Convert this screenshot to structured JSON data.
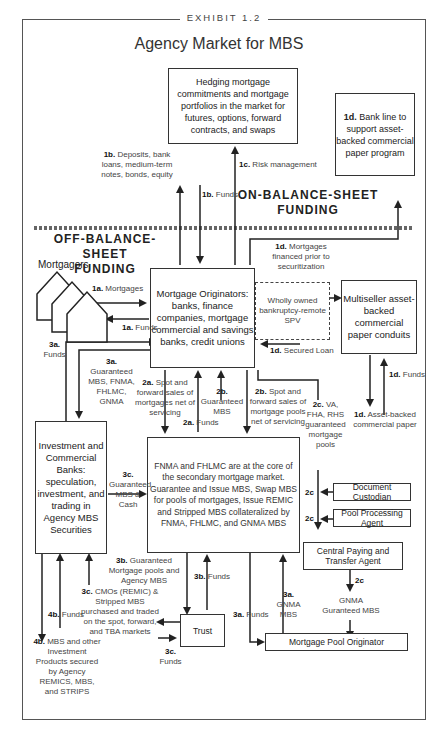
{
  "exhibit": "EXHIBIT 1.2",
  "title": "Agency Market for MBS",
  "sections": {
    "on_balance": "ON-BALANCE-SHEET FUNDING",
    "off_balance": "OFF-BALANCE-SHEET FUNDING"
  },
  "nodes": {
    "hedging": "Hedging mortgage commitments and mortgage portfolios in the market for futures, options, forward contracts, and swaps",
    "bank_line": {
      "tag": "1d.",
      "text": "Bank line to support asset-backed commercial paper program"
    },
    "mortgagors": "Mortgagors",
    "originators": "Mortgage Originators: banks, finance companies, mortgage commercial and savings banks, credit unions",
    "spv": "Wholly owned bankruptcy-remote SPV",
    "conduits": "Multiseller asset-backed commercial paper conduits",
    "investment_banks": "Investment and Commercial Banks: speculation, investment, and trading in Agency MBS Securities",
    "fnma": "FNMA and FHLMC are at the core of the secondary mortgage market. Guarantee and Issue MBS, Swap MBS for pools of mortgages, Issue REMIC and Stripped MBS collateralized by FNMA, FHLMC, and GNMA MBS",
    "document_custodian": "Document Custodian",
    "pool_processing": "Pool Processing Agent",
    "central_paying": "Central Paying and Transfer Agent",
    "trust": "Trust",
    "pool_originator": "Mortgage Pool Originator"
  },
  "labels": {
    "l1b_deposits": {
      "tag": "1b.",
      "text": "Deposits, bank loans, medium-term notes, bonds, equity"
    },
    "l1b_funds": {
      "tag": "1b.",
      "text": "Funds"
    },
    "l1c": {
      "tag": "1c.",
      "text": "Risk management"
    },
    "l1a_mortgages": {
      "tag": "1a.",
      "text": "Mortgages"
    },
    "l1a_funds": {
      "tag": "1a.",
      "text": "Funds"
    },
    "l1d_mortgages": {
      "tag": "1d.",
      "text": "Mortgages financed prior to securitization"
    },
    "l1d_secured": {
      "tag": "1d.",
      "text": "Secured Loan"
    },
    "l1d_funds": {
      "tag": "1d.",
      "text": "Funds"
    },
    "l1d_abcp": {
      "tag": "1d.",
      "text": "Asset-backed commercial paper"
    },
    "l3a_funds_left": {
      "tag": "3a.",
      "text": "Funds"
    },
    "l3a_guaranteed": {
      "tag": "3a.",
      "text": "Guaranteed MBS, FNMA, FHLMC, GNMA"
    },
    "l2a_spot": {
      "tag": "2a.",
      "text": "Spot and forward sales of mortgages net of servicing"
    },
    "l2a_funds": {
      "tag": "2a.",
      "text": "Funds"
    },
    "l2b_guaranteed": {
      "tag": "2b.",
      "text": "Guaranteed MBS"
    },
    "l2b_spot": {
      "tag": "2b.",
      "text": "Spot and forward sales of mortgage pools net of servicing"
    },
    "l2c_va": {
      "tag": "2c.",
      "text": "VA, FHA, RHS guaranteed mortgage pools"
    },
    "l2c_1": {
      "tag": "2c",
      "text": ""
    },
    "l2c_2": {
      "tag": "2c",
      "text": ""
    },
    "l2c_3": {
      "tag": "2c",
      "text": ""
    },
    "l3c_guaranteed": {
      "tag": "3c.",
      "text": "Guaranteed MBS & Cash"
    },
    "l3b_guaranteed": {
      "tag": "3b.",
      "text": "Guaranteed Mortgage pools and Agency MBS"
    },
    "l3b_funds": {
      "tag": "3b.",
      "text": "Funds"
    },
    "l3c_cmos": {
      "tag": "3c.",
      "text": "CMOs (REMIC) & Stripped MBS purchased and traded on the spot, forward, and TBA markets"
    },
    "l3c_funds": {
      "tag": "3c.",
      "text": "Funds"
    },
    "l3a_funds_right": {
      "tag": "3a.",
      "text": "Funds"
    },
    "l3a_gnma": {
      "tag": "3a.",
      "text": "GNMA MBS"
    },
    "gnma_guaranteed": {
      "tag": "",
      "text": "GNMA Guranteed MBS"
    },
    "l4b_funds": {
      "tag": "4b.",
      "text": "Funds"
    },
    "l4b_mbs": {
      "tag": "4b.",
      "text": "MBS and other Investment Products secured by Agency REMICS, MBS, and STRIPS"
    }
  }
}
